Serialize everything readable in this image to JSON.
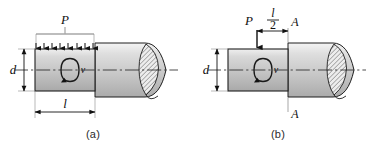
{
  "figure": {
    "background_color": "#ffffff",
    "line_color": "#1a1a1a",
    "shaft_fill_light": "#f2f2f2",
    "shaft_fill_mid": "#c9c9c9",
    "shaft_fill_dark": "#b0b0b0",
    "hatch_color": "#3a3a3a"
  },
  "panels": [
    {
      "id": "a",
      "caption": "(a)",
      "load": {
        "type": "distributed",
        "label": "P",
        "arrow_count": 8,
        "direction": "down"
      },
      "torque": {
        "label": "v",
        "symbol": "rotation-arrow"
      },
      "dimensions": [
        {
          "name": "diameter",
          "label": "d",
          "orientation": "vertical",
          "position": "left"
        },
        {
          "name": "length",
          "label": "l",
          "orientation": "horizontal",
          "position": "bottom"
        }
      ],
      "section_labels": []
    },
    {
      "id": "b",
      "caption": "(b)",
      "load": {
        "type": "concentrated",
        "label": "P",
        "arrow_count": 1,
        "direction": "down"
      },
      "torque": {
        "label": "v",
        "symbol": "rotation-arrow"
      },
      "dimensions": [
        {
          "name": "diameter",
          "label": "d",
          "orientation": "vertical",
          "position": "left"
        },
        {
          "name": "half-length",
          "label_numerator": "l",
          "label_denominator": "2",
          "orientation": "horizontal",
          "position": "top"
        }
      ],
      "section_labels": [
        {
          "label": "A",
          "position": "top"
        },
        {
          "label": "A",
          "position": "bottom"
        }
      ]
    }
  ]
}
